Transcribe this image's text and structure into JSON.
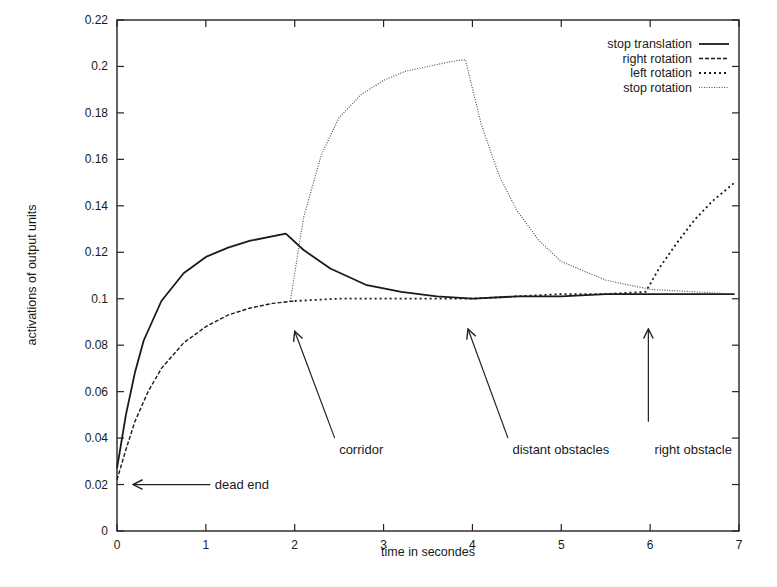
{
  "chart_data": {
    "type": "line",
    "title": "",
    "xlabel": "time in secondes",
    "ylabel": "activations of output units",
    "xlim": [
      0,
      7
    ],
    "ylim": [
      0,
      0.22
    ],
    "xticks": [
      "0",
      "1",
      "2",
      "3",
      "4",
      "5",
      "6",
      "7"
    ],
    "yticks": [
      "0",
      "0.02",
      "0.04",
      "0.06",
      "0.08",
      "0.1",
      "0.12",
      "0.14",
      "0.16",
      "0.18",
      "0.2",
      "0.22"
    ],
    "grid": false,
    "legend_position": "upper right",
    "series": [
      {
        "name": "stop translation",
        "style": "solid",
        "x": [
          0,
          0.1,
          0.2,
          0.3,
          0.5,
          0.75,
          1.0,
          1.25,
          1.5,
          1.9,
          2.1,
          2.4,
          2.8,
          3.2,
          3.6,
          4.0,
          4.5,
          5.0,
          5.5,
          6.0,
          6.5,
          6.95
        ],
        "y": [
          0.027,
          0.05,
          0.068,
          0.082,
          0.099,
          0.111,
          0.118,
          0.122,
          0.125,
          0.128,
          0.121,
          0.113,
          0.106,
          0.103,
          0.101,
          0.1,
          0.101,
          0.101,
          0.102,
          0.102,
          0.102,
          0.102
        ]
      },
      {
        "name": "right rotation",
        "style": "dashed",
        "x": [
          0,
          0.1,
          0.2,
          0.35,
          0.5,
          0.75,
          1.0,
          1.25,
          1.5,
          1.75,
          2.0
        ],
        "y": [
          0.022,
          0.035,
          0.047,
          0.06,
          0.07,
          0.081,
          0.088,
          0.093,
          0.096,
          0.098,
          0.099
        ]
      },
      {
        "name": "left rotation",
        "style": "dotted-coarse",
        "x": [
          2.0,
          2.5,
          3.0,
          3.5,
          4.0,
          4.5,
          5.0,
          5.5,
          5.95,
          6.1,
          6.3,
          6.5,
          6.7,
          6.95
        ],
        "y": [
          0.099,
          0.1,
          0.1,
          0.1,
          0.1,
          0.101,
          0.102,
          0.102,
          0.103,
          0.113,
          0.124,
          0.134,
          0.142,
          0.15
        ]
      },
      {
        "name": "stop rotation",
        "style": "dotted-fine",
        "x": [
          1.95,
          2.1,
          2.3,
          2.5,
          2.75,
          3.0,
          3.25,
          3.5,
          3.75,
          3.92,
          4.1,
          4.3,
          4.5,
          4.75,
          5.0,
          5.5,
          6.0,
          6.5,
          6.95
        ],
        "y": [
          0.099,
          0.135,
          0.162,
          0.178,
          0.188,
          0.194,
          0.198,
          0.2,
          0.202,
          0.203,
          0.175,
          0.153,
          0.138,
          0.125,
          0.116,
          0.108,
          0.104,
          0.103,
          0.102
        ]
      }
    ],
    "annotations": [
      {
        "text": "dead end",
        "arrow_from": [
          1.05,
          0.02
        ],
        "arrow_to": [
          0.18,
          0.02
        ],
        "text_at": [
          1.1,
          0.02
        ]
      },
      {
        "text": "corridor",
        "arrow_from": [
          2.45,
          0.04
        ],
        "arrow_to": [
          2.0,
          0.086
        ],
        "text_at": [
          2.5,
          0.035
        ]
      },
      {
        "text": "distant obstacles",
        "arrow_from": [
          4.4,
          0.04
        ],
        "arrow_to": [
          3.95,
          0.087
        ],
        "text_at": [
          4.45,
          0.035
        ]
      },
      {
        "text": "right obstacle",
        "arrow_from": [
          5.98,
          0.047
        ],
        "arrow_to": [
          5.98,
          0.087
        ],
        "text_at": [
          6.05,
          0.035
        ]
      }
    ]
  },
  "figure": {
    "ylabel": "activations of output units",
    "xlabel": "time in secondes",
    "legend": [
      {
        "label": "stop translation"
      },
      {
        "label": "right rotation"
      },
      {
        "label": "left rotation"
      },
      {
        "label": "stop rotation"
      }
    ],
    "annotations": [
      "dead end",
      "corridor",
      "distant obstacles",
      "right obstacle"
    ]
  }
}
